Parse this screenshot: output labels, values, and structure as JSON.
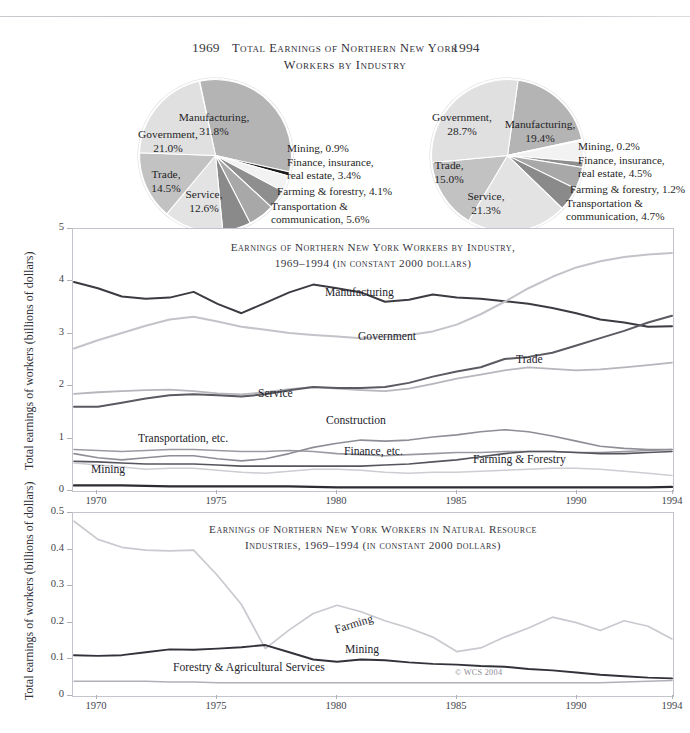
{
  "figure": {
    "copyright": "© WCS 2004"
  },
  "pies": {
    "title": "Total Earnings of Northern New York Workers by Industry",
    "title_line1": "Total Earnings of Northern New York",
    "title_line2": "Workers by Industry",
    "left_year": "1969",
    "right_year": "1994",
    "y1969": {
      "year": "1969",
      "slices": [
        {
          "label": "Manufacturing,",
          "value_label": "31.8%",
          "value": 31.8,
          "color": "#b4b4b4"
        },
        {
          "label": "Mining,",
          "value_label": "0.9%",
          "value": 0.9,
          "color": "#1c1c1c"
        },
        {
          "label": "Finance, insurance,",
          "label2": "real estate,",
          "value_label": "3.4%",
          "value": 3.4,
          "color": "#f2f2f2"
        },
        {
          "label": "Farming & forestry,",
          "value_label": "4.1%",
          "value": 4.1,
          "color": "#8e8e8e"
        },
        {
          "label": "Transportation &",
          "label2": "communication,",
          "value_label": "5.6%",
          "value": 5.6,
          "color": "#a8a8a8"
        },
        {
          "label": "Construction,",
          "value_label": "6.0%",
          "value": 6.0,
          "color": "#8a8a8a"
        },
        {
          "label": "Service,",
          "value_label": "12.6%",
          "value": 12.6,
          "color": "#e3e3e3"
        },
        {
          "label": "Trade,",
          "value_label": "14.5%",
          "value": 14.5,
          "color": "#c2c2c2"
        },
        {
          "label": "Government,",
          "value_label": "21.0%",
          "value": 21.0,
          "color": "#e0e0e0"
        }
      ]
    },
    "y1994": {
      "year": "1994",
      "slices": [
        {
          "label": "Manufacturing,",
          "value_label": "19.4%",
          "value": 19.4,
          "color": "#b4b4b4"
        },
        {
          "label": "Mining,",
          "value_label": "0.2%",
          "value": 0.2,
          "color": "#1c1c1c"
        },
        {
          "label": "Finance, insurance,",
          "label2": "real estate,",
          "value_label": "4.5%",
          "value": 4.5,
          "color": "#f2f2f2"
        },
        {
          "label": "Farming & forestry,",
          "value_label": "1.2%",
          "value": 1.2,
          "color": "#8e8e8e"
        },
        {
          "label": "Transportation &",
          "label2": "communication,",
          "value_label": "4.7%",
          "value": 4.7,
          "color": "#a8a8a8"
        },
        {
          "label": "Construction,",
          "value_label": "5.0%",
          "value": 5.0,
          "color": "#8a8a8a"
        },
        {
          "label": "Service,",
          "value_label": "21.3%",
          "value": 21.3,
          "color": "#e3e3e3"
        },
        {
          "label": "Trade,",
          "value_label": "15.0%",
          "value": 15.0,
          "color": "#c2c2c2"
        },
        {
          "label": "Government,",
          "value_label": "28.7%",
          "value": 28.7,
          "color": "#e0e0e0"
        }
      ]
    }
  },
  "chart_main": {
    "title_line1": "Earnings of Northern New York Workers by Industry,",
    "title_line2": "1969–1994 (in constant 2000 dollars)",
    "ylabel": "Total earnings of workers (billions of dollars)",
    "yticks": [
      "0",
      "1",
      "2",
      "3",
      "4",
      "5"
    ],
    "xticks": [
      "1970",
      "1975",
      "1980",
      "1985",
      "1990",
      "1994"
    ]
  },
  "chart_nat": {
    "title_line1": "Earnings of Northern New York Workers in Natural Resource",
    "title_line2": "Industries, 1969–1994 (in constant 2000 dollars)",
    "ylabel": "Total earnings of workers (billions of dollars)",
    "yticks": [
      "0",
      "0.1",
      "0.2",
      "0.3",
      "0.4",
      "0.5"
    ],
    "xticks": [
      "1970",
      "1975",
      "1980",
      "1985",
      "1990",
      "1994"
    ]
  },
  "chart_data": [
    {
      "type": "line",
      "id": "main",
      "title": "Earnings of Northern New York Workers by Industry, 1969–1994 (in constant 2000 dollars)",
      "xlabel": "",
      "ylabel": "Total earnings of workers (billions of dollars)",
      "xlim": [
        1969,
        1994
      ],
      "ylim": [
        0,
        5
      ],
      "grid": false,
      "legend": "inline-labels",
      "x": [
        1969,
        1970,
        1971,
        1972,
        1973,
        1974,
        1975,
        1976,
        1977,
        1978,
        1979,
        1980,
        1981,
        1982,
        1983,
        1984,
        1985,
        1986,
        1987,
        1988,
        1989,
        1990,
        1991,
        1992,
        1993,
        1994
      ],
      "series": [
        {
          "name": "Manufacturing",
          "color": "#3b3b41",
          "width": 2.0,
          "values": [
            4.0,
            3.88,
            3.72,
            3.68,
            3.7,
            3.81,
            3.58,
            3.4,
            3.6,
            3.8,
            3.95,
            3.88,
            3.8,
            3.62,
            3.66,
            3.76,
            3.7,
            3.68,
            3.63,
            3.58,
            3.5,
            3.4,
            3.28,
            3.22,
            3.14,
            3.15
          ]
        },
        {
          "name": "Government",
          "color": "#c3c3c9",
          "width": 2.0,
          "values": [
            2.72,
            2.88,
            3.02,
            3.16,
            3.28,
            3.33,
            3.24,
            3.14,
            3.08,
            3.02,
            2.98,
            2.95,
            2.92,
            2.94,
            2.98,
            3.05,
            3.18,
            3.38,
            3.62,
            3.88,
            4.1,
            4.28,
            4.4,
            4.48,
            4.53,
            4.56
          ]
        },
        {
          "name": "Trade",
          "color": "#b6b6bc",
          "width": 1.8,
          "values": [
            1.85,
            1.88,
            1.9,
            1.92,
            1.93,
            1.9,
            1.86,
            1.84,
            1.88,
            1.94,
            1.98,
            1.95,
            1.92,
            1.9,
            1.95,
            2.04,
            2.14,
            2.22,
            2.3,
            2.36,
            2.33,
            2.3,
            2.32,
            2.36,
            2.4,
            2.45
          ]
        },
        {
          "name": "Service",
          "color": "#5a5a62",
          "width": 2.0,
          "values": [
            1.6,
            1.6,
            1.68,
            1.76,
            1.82,
            1.84,
            1.82,
            1.8,
            1.84,
            1.92,
            1.98,
            1.96,
            1.96,
            1.98,
            2.06,
            2.18,
            2.28,
            2.36,
            2.52,
            2.56,
            2.64,
            2.78,
            2.92,
            3.06,
            3.22,
            3.35
          ]
        },
        {
          "name": "Transportation, etc.",
          "color": "#9a9aa2",
          "width": 1.6,
          "values": [
            0.78,
            0.76,
            0.74,
            0.76,
            0.78,
            0.78,
            0.76,
            0.74,
            0.74,
            0.76,
            0.74,
            0.7,
            0.68,
            0.66,
            0.68,
            0.7,
            0.72,
            0.72,
            0.74,
            0.74,
            0.74,
            0.72,
            0.72,
            0.74,
            0.76,
            0.78
          ]
        },
        {
          "name": "Construction",
          "color": "#8e8e96",
          "width": 1.6,
          "values": [
            0.7,
            0.62,
            0.58,
            0.62,
            0.66,
            0.66,
            0.6,
            0.56,
            0.6,
            0.7,
            0.82,
            0.9,
            0.96,
            0.94,
            0.96,
            1.02,
            1.06,
            1.12,
            1.16,
            1.12,
            1.04,
            0.94,
            0.84,
            0.8,
            0.78,
            0.78
          ]
        },
        {
          "name": "Finance, etc.",
          "color": "#55555d",
          "width": 1.6,
          "values": [
            0.55,
            0.54,
            0.52,
            0.5,
            0.5,
            0.5,
            0.48,
            0.46,
            0.46,
            0.46,
            0.46,
            0.46,
            0.46,
            0.48,
            0.5,
            0.54,
            0.58,
            0.64,
            0.7,
            0.74,
            0.74,
            0.72,
            0.7,
            0.7,
            0.72,
            0.74
          ]
        },
        {
          "name": "Farming & Forestry",
          "color": "#cdcdd3",
          "width": 1.5,
          "values": [
            0.52,
            0.48,
            0.44,
            0.4,
            0.42,
            0.42,
            0.38,
            0.34,
            0.32,
            0.36,
            0.4,
            0.4,
            0.38,
            0.34,
            0.32,
            0.34,
            0.34,
            0.36,
            0.38,
            0.4,
            0.42,
            0.42,
            0.4,
            0.36,
            0.32,
            0.28
          ]
        },
        {
          "name": "Mining",
          "color": "#2c2c32",
          "width": 2.2,
          "values": [
            0.09,
            0.09,
            0.09,
            0.08,
            0.07,
            0.07,
            0.07,
            0.07,
            0.07,
            0.07,
            0.06,
            0.05,
            0.05,
            0.05,
            0.05,
            0.05,
            0.05,
            0.05,
            0.05,
            0.05,
            0.05,
            0.05,
            0.05,
            0.05,
            0.05,
            0.06
          ]
        }
      ]
    },
    {
      "type": "line",
      "id": "natural-resource",
      "title": "Earnings of Northern New York Workers in Natural Resource Industries, 1969–1994 (in constant 2000 dollars)",
      "xlabel": "",
      "ylabel": "Total earnings of workers (billions of dollars)",
      "xlim": [
        1969,
        1994
      ],
      "ylim": [
        0,
        0.5
      ],
      "grid": false,
      "legend": "inline-labels",
      "x": [
        1969,
        1970,
        1971,
        1972,
        1973,
        1974,
        1975,
        1976,
        1977,
        1978,
        1979,
        1980,
        1981,
        1982,
        1983,
        1984,
        1985,
        1986,
        1987,
        1988,
        1989,
        1990,
        1991,
        1992,
        1993,
        1994
      ],
      "series": [
        {
          "name": "Farming",
          "color": "#c9c9cf",
          "width": 1.7,
          "values": [
            0.48,
            0.43,
            0.408,
            0.4,
            0.398,
            0.4,
            0.33,
            0.25,
            0.128,
            0.18,
            0.225,
            0.248,
            0.23,
            0.205,
            0.185,
            0.16,
            0.12,
            0.13,
            0.16,
            0.185,
            0.215,
            0.2,
            0.178,
            0.205,
            0.19,
            0.155
          ]
        },
        {
          "name": "Mining",
          "color": "#32323a",
          "width": 1.9,
          "values": [
            0.11,
            0.108,
            0.11,
            0.118,
            0.126,
            0.125,
            0.128,
            0.132,
            0.138,
            0.118,
            0.098,
            0.092,
            0.098,
            0.096,
            0.09,
            0.086,
            0.084,
            0.08,
            0.078,
            0.072,
            0.068,
            0.062,
            0.056,
            0.052,
            0.048,
            0.046
          ]
        },
        {
          "name": "Forestry & Agricultural Services",
          "color": "#b0b0b8",
          "width": 1.5,
          "values": [
            0.038,
            0.038,
            0.038,
            0.038,
            0.036,
            0.036,
            0.034,
            0.034,
            0.034,
            0.034,
            0.034,
            0.034,
            0.034,
            0.034,
            0.034,
            0.034,
            0.034,
            0.034,
            0.034,
            0.034,
            0.034,
            0.034,
            0.034,
            0.036,
            0.038,
            0.04
          ]
        }
      ]
    }
  ]
}
